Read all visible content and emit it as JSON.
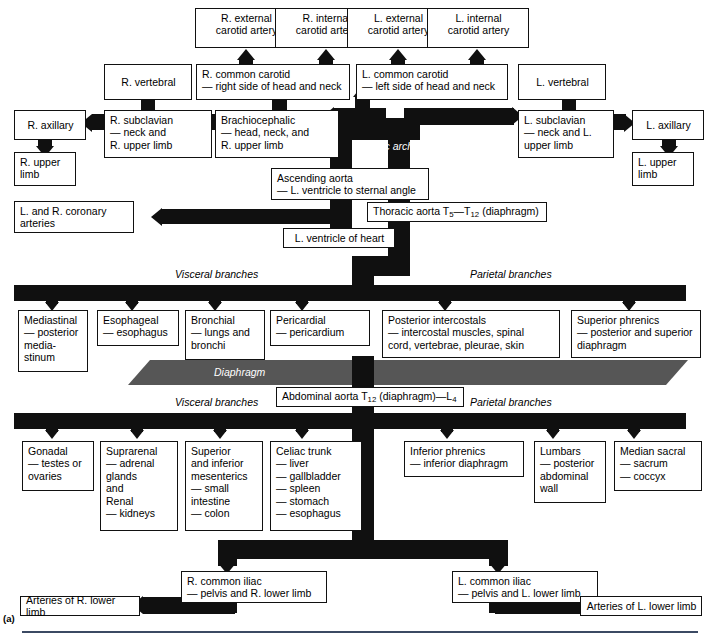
{
  "figure": {
    "panel_label": "(a)",
    "aortic_arch_label": "Aortic arch",
    "diaphragm_label": "Diaphragm",
    "visceral_branches_thoracic": "Visceral branches",
    "parietal_branches_thoracic": "Parietal branches",
    "visceral_branches_abdominal": "Visceral branches",
    "parietal_branches_abdominal": "Parietal branches"
  },
  "colors": {
    "vessel": "#101010",
    "diaphragm": "#565656",
    "box_border": "#111111",
    "rule": "#3b4a63"
  },
  "boxes": {
    "r_external_carotid": "R. external\ncarotid artery",
    "r_internal_carotid": "R. internal\ncarotid artery",
    "l_external_carotid": "L. external\ncarotid artery",
    "l_internal_carotid": "L. internal\ncarotid artery",
    "r_vertebral": "R. vertebral",
    "l_vertebral": "L. vertebral",
    "r_common_carotid": "R. common carotid\n— right side of head and neck",
    "l_common_carotid": "L. common carotid\n— left side of head and neck",
    "r_axillary": "R. axillary",
    "l_axillary": "L. axillary",
    "r_subclavian": "R. subclavian\n— neck and\n   R. upper limb",
    "l_subclavian": "L. subclavian\n— neck and L.\n   upper limb",
    "brachiocephalic": "Brachiocephalic\n— head, neck, and\n   R. upper limb",
    "r_upper_limb": "R. upper\nlimb",
    "l_upper_limb": "L. upper\nlimb",
    "ascending_aorta": "Ascending aorta\n— L. ventricle to sternal angle",
    "coronary_arteries": "L. and R. coronary\narteries",
    "l_ventricle_of_heart": "L. ventricle of heart",
    "thoracic_aorta_pre": "Thoracic aorta T",
    "thoracic_aorta_sub1": "5",
    "thoracic_aorta_mid": "—T",
    "thoracic_aorta_sub2": "12",
    "thoracic_aorta_post": " (diaphragm)",
    "abdominal_aorta_pre": "Abdominal aorta T",
    "abdominal_aorta_sub1": "12",
    "abdominal_aorta_mid": " (diaphragm)—L",
    "abdominal_aorta_sub2": "4",
    "mediastinal": "Mediastinal\n— posterior\n   media-\n   stinum",
    "esophageal": "Esophageal\n— esophagus",
    "bronchial": "Bronchial\n— lungs and\n   bronchi",
    "pericardial": "Pericardial\n— pericardium",
    "posterior_intercostals": "Posterior intercostals\n— intercostal muscles, spinal\n   cord, vertebrae, pleurae, skin",
    "superior_phrenics": "Superior phrenics\n— posterior and superior\n   diaphragm",
    "gonadal": "Gonadal\n— testes or\n   ovaries",
    "suprarenal_renal": "Suprarenal\n— adrenal\n   glands\n   and\nRenal\n— kidneys",
    "mesenterics": "Superior\nand inferior\nmesenterics\n— small\n   intestine\n— colon",
    "celiac_trunk": "Celiac trunk\n— liver\n— gallbladder\n— spleen\n— stomach\n— esophagus",
    "inferior_phrenics": "Inferior phrenics\n— inferior diaphragm",
    "lumbars": "Lumbars\n— posterior\n   abdominal\n   wall",
    "median_sacral": "Median sacral\n— sacrum\n— coccyx",
    "r_common_iliac": "R. common iliac\n— pelvis and R. lower limb",
    "l_common_iliac": "L. common iliac\n— pelvis and L. lower limb",
    "arteries_r_lower_limb": "Arteries of R. lower limb",
    "arteries_l_lower_limb": "Arteries of L. lower limb"
  }
}
